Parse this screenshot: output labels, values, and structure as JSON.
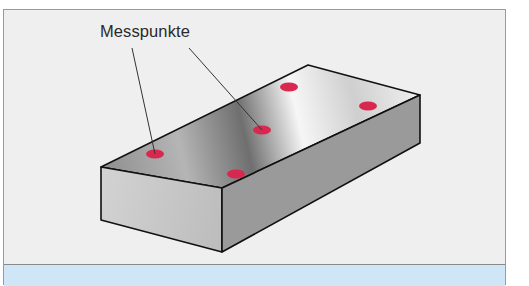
{
  "diagram": {
    "label": "Messpunkte",
    "object": "rectangular-block",
    "measurement_points_count": 5,
    "colors": {
      "background": "#efefef",
      "border": "#9a9a9a",
      "caption_bar": "#cfe6f6",
      "point": "#d8284f",
      "edge": "#111111"
    }
  }
}
